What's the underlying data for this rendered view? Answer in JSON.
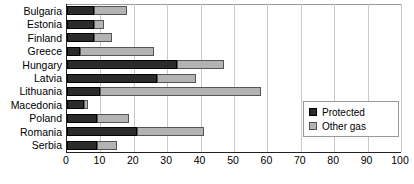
{
  "chart_data": {
    "type": "bar",
    "orientation": "horizontal",
    "stacked": true,
    "title": "",
    "xlabel": "",
    "ylabel": "",
    "xlim": [
      0,
      100
    ],
    "xticks": [
      0,
      10,
      20,
      30,
      40,
      50,
      60,
      70,
      80,
      90,
      100
    ],
    "grid": true,
    "legend_position": "right-inside",
    "categories": [
      "Bulgaria",
      "Estonia",
      "Finland",
      "Greece",
      "Hungary",
      "Latvia",
      "Lithuania",
      "Macedonia",
      "Poland",
      "Romania",
      "Serbia"
    ],
    "series": [
      {
        "name": "Protected",
        "color": "#2b2b2b",
        "values": [
          8,
          8,
          8,
          4,
          33,
          27,
          10,
          5,
          9,
          21,
          9
        ]
      },
      {
        "name": "Other gas",
        "color": "#b3b3b3",
        "values": [
          10,
          3,
          5.5,
          22,
          14,
          11.5,
          48,
          1.3,
          9.5,
          20,
          6
        ]
      }
    ],
    "totals": [
      18,
      11,
      13.5,
      26,
      47,
      38.5,
      58,
      6.3,
      18.5,
      41,
      15
    ]
  },
  "legend": {
    "items": [
      {
        "label": "Protected",
        "swatch": "protected"
      },
      {
        "label": "Other gas",
        "swatch": "other"
      }
    ]
  },
  "axis": {
    "tick_labels": [
      "0",
      "10",
      "20",
      "30",
      "40",
      "50",
      "60",
      "70",
      "80",
      "90",
      "100"
    ]
  }
}
